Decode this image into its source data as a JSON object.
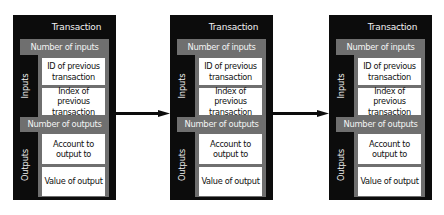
{
  "diagram": {
    "colors": {
      "outer": "#0c0c0c",
      "section": "#6f6f6f",
      "field": "#ffffff",
      "arrow": "#0c0c0c"
    },
    "transactions": [
      {
        "title": "Transaction",
        "inputs": {
          "side_label": "Inputs",
          "count_label": "Number of inputs",
          "fields": [
            "ID of previous transaction",
            "Index of previous transaction"
          ]
        },
        "outputs": {
          "side_label": "Outputs",
          "count_label": "Number of outputs",
          "fields": [
            "Account to output to",
            "Value of output"
          ]
        }
      },
      {
        "title": "Transaction",
        "inputs": {
          "side_label": "Inputs",
          "count_label": "Number of inputs",
          "fields": [
            "ID of previous transaction",
            "Index of previous transaction"
          ]
        },
        "outputs": {
          "side_label": "Outputs",
          "count_label": "Number of outputs",
          "fields": [
            "Account to output to",
            "Value of output"
          ]
        }
      },
      {
        "title": "Transaction",
        "inputs": {
          "side_label": "Inputs",
          "count_label": "Number of inputs",
          "fields": [
            "ID of previous transaction",
            "Index of previous transaction"
          ]
        },
        "outputs": {
          "side_label": "Outputs",
          "count_label": "Number of outputs",
          "fields": [
            "Account to output to",
            "Value of output"
          ]
        }
      }
    ],
    "connections": [
      {
        "from": 0,
        "to": 1,
        "style": "arrow"
      },
      {
        "from": 1,
        "to": 2,
        "style": "arrow"
      }
    ]
  }
}
